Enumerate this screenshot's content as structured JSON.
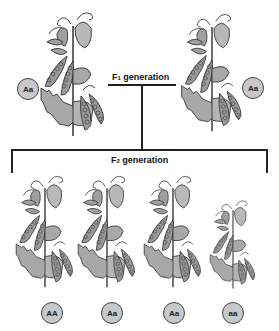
{
  "diagram": {
    "f1": {
      "label_prefix": "F",
      "label_sub": "1",
      "label_suffix": " generation",
      "plants": [
        {
          "genotype": "Aa"
        },
        {
          "genotype": "Aa"
        }
      ]
    },
    "f2": {
      "label_prefix": "F",
      "label_sub": "2",
      "label_suffix": " generation",
      "plants": [
        {
          "genotype": "AA"
        },
        {
          "genotype": "Aa"
        },
        {
          "genotype": "Aa"
        },
        {
          "genotype": "aa"
        }
      ]
    },
    "colors": {
      "plant_fill": "#a8a8a8",
      "badge_fill": "#c8c8c8",
      "line": "#222222"
    }
  }
}
